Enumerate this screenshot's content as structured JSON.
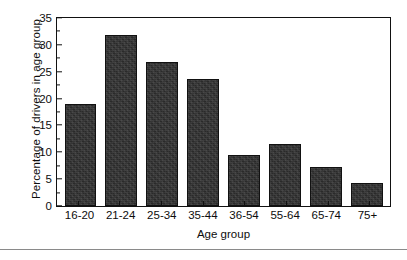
{
  "chart_data": {
    "type": "bar",
    "title": "",
    "xlabel": "Age group",
    "ylabel": "Percentage of drivers in age group",
    "categories": [
      "16-20",
      "21-24",
      "25-34",
      "35-44",
      "36-54",
      "55-64",
      "65-74",
      "75+"
    ],
    "values": [
      19.0,
      31.9,
      26.9,
      23.7,
      9.5,
      11.5,
      7.3,
      4.2
    ],
    "ylim": [
      0,
      35
    ],
    "ytick_labels": [
      "0",
      "5",
      "10",
      "15",
      "20",
      "25",
      "30",
      "35"
    ],
    "ytick_values": [
      0,
      5,
      10,
      15,
      20,
      25,
      30,
      35
    ],
    "yminor_values": [
      2.5,
      7.5,
      12.5,
      17.5,
      22.5,
      27.5,
      32.5
    ],
    "grid": false,
    "legend": null,
    "legend_position": "none",
    "bar_color": "#2f2f2f",
    "bar_edge_color": "#111111",
    "axis_color": "#111111",
    "background_color": "#ffffff"
  },
  "figure": {
    "rule_color": "#8a8a8a"
  }
}
